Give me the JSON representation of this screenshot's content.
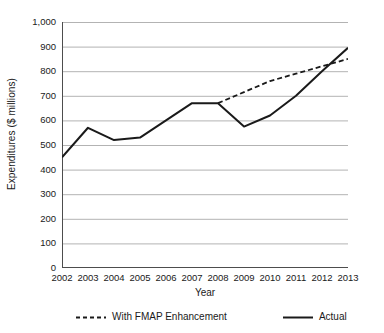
{
  "chart_data": {
    "type": "line",
    "title": "",
    "xlabel": "Year",
    "ylabel": "Expenditures ($ millions)",
    "categories": [
      2002,
      2003,
      2004,
      2005,
      2006,
      2007,
      2008,
      2009,
      2010,
      2011,
      2012,
      2013
    ],
    "x_tick_labels": [
      "2002",
      "2003",
      "2004",
      "2005",
      "2006",
      "2007",
      "2008",
      "2009",
      "2010",
      "2011",
      "2012",
      "2013"
    ],
    "y_tick_labels": [
      "1,000",
      "900",
      "800",
      "700",
      "600",
      "500",
      "400",
      "300",
      "200",
      "100",
      "0"
    ],
    "y_tick_values": [
      1000,
      900,
      800,
      700,
      600,
      500,
      400,
      300,
      200,
      100,
      0
    ],
    "ylim": [
      0,
      1000
    ],
    "xlim": [
      2002,
      2013
    ],
    "grid": "horizontal",
    "legend_position": "bottom",
    "series": [
      {
        "name": "With FMAP Enhancement",
        "style": "dashed",
        "color": "#1a1a1a",
        "x": [
          2008,
          2009,
          2010,
          2011,
          2012,
          2013
        ],
        "values": [
          670,
          715,
          760,
          790,
          820,
          850
        ]
      },
      {
        "name": "Actual",
        "style": "solid",
        "color": "#1a1a1a",
        "x": [
          2002,
          2003,
          2004,
          2005,
          2006,
          2007,
          2008,
          2009,
          2010,
          2011,
          2012,
          2013
        ],
        "values": [
          450,
          570,
          520,
          530,
          600,
          670,
          670,
          575,
          620,
          700,
          800,
          895
        ]
      }
    ]
  },
  "axis": {
    "y_title": "Expenditures ($ millions)",
    "x_title": "Year"
  },
  "legend": {
    "items": [
      {
        "label": "With FMAP Enhancement",
        "style": "dashed"
      },
      {
        "label": "Actual",
        "style": "solid"
      }
    ]
  },
  "colors": {
    "line": "#1a1a1a",
    "grid": "#b3b3b3",
    "axis": "#4d4d4d",
    "background": "#ffffff"
  }
}
